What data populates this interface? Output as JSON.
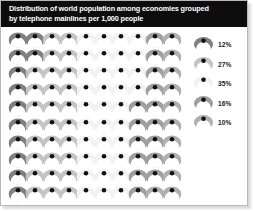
{
  "title": {
    "line1": "Distribution of world population among economies grouped",
    "line2": "by telephone mainlines per 1,000 people"
  },
  "colors": {
    "title_bar_bg": "#0d0d0d",
    "title_text": "#ffffff",
    "figure_bg": "#ffffff",
    "border": "#b9b9b9",
    "shade_1": "#808080",
    "shade_2": "#c4c4c4",
    "shade_3": "#f2f2f2",
    "shade_4": "#9f9f9f",
    "shade_5": "#b0b0b0",
    "icon_outline": "#ffffff",
    "icon_dot": "#111111"
  },
  "legend": {
    "items": [
      {
        "label": "12%",
        "shade": "#808080",
        "icon": "person-icon"
      },
      {
        "label": "27%",
        "shade": "#c4c4c4",
        "icon": "person-icon"
      },
      {
        "label": "35%",
        "shade": "#f2f2f2",
        "icon": "person-icon"
      },
      {
        "label": "16%",
        "shade": "#9f9f9f",
        "icon": "person-icon"
      },
      {
        "label": "10%",
        "shade": "#b0b0b0",
        "icon": "person-icon"
      }
    ]
  },
  "chart_data": {
    "type": "pictogram",
    "title": "Distribution of world population among economies grouped by telephone mainlines per 1,000 people",
    "xlabel": "",
    "ylabel": "",
    "unit": "1 icon = 1% of world population",
    "grid_rows": 10,
    "grid_cols": 10,
    "total_icons": 100,
    "categories": [
      "12%",
      "27%",
      "35%",
      "16%",
      "10%"
    ],
    "values": [
      12,
      27,
      35,
      16,
      10
    ],
    "series": [
      {
        "name": "group-1",
        "value": 12,
        "shade": "#808080"
      },
      {
        "name": "group-2",
        "value": 27,
        "shade": "#c4c4c4"
      },
      {
        "name": "group-3",
        "value": 35,
        "shade": "#f2f2f2"
      },
      {
        "name": "group-4",
        "value": 16,
        "shade": "#9f9f9f"
      },
      {
        "name": "group-5",
        "value": 10,
        "shade": "#b0b0b0"
      }
    ],
    "legend_position": "right",
    "grid": false,
    "cell_shades": [
      [
        "#808080",
        "#808080",
        "#c4c4c4",
        "#c4c4c4",
        "#f2f2f2",
        "#f2f2f2",
        "#f2f2f2",
        "#f2f2f2",
        "#9f9f9f",
        "#b0b0b0"
      ],
      [
        "#808080",
        "#808080",
        "#c4c4c4",
        "#c4c4c4",
        "#f2f2f2",
        "#f2f2f2",
        "#f2f2f2",
        "#f2f2f2",
        "#9f9f9f",
        "#b0b0b0"
      ],
      [
        "#808080",
        "#c4c4c4",
        "#c4c4c4",
        "#c4c4c4",
        "#f2f2f2",
        "#f2f2f2",
        "#f2f2f2",
        "#f2f2f2",
        "#9f9f9f",
        "#b0b0b0"
      ],
      [
        "#808080",
        "#c4c4c4",
        "#c4c4c4",
        "#c4c4c4",
        "#f2f2f2",
        "#f2f2f2",
        "#f2f2f2",
        "#f2f2f2",
        "#9f9f9f",
        "#b0b0b0"
      ],
      [
        "#808080",
        "#c4c4c4",
        "#c4c4c4",
        "#c4c4c4",
        "#f2f2f2",
        "#f2f2f2",
        "#f2f2f2",
        "#9f9f9f",
        "#9f9f9f",
        "#b0b0b0"
      ],
      [
        "#808080",
        "#c4c4c4",
        "#c4c4c4",
        "#c4c4c4",
        "#f2f2f2",
        "#f2f2f2",
        "#f2f2f2",
        "#9f9f9f",
        "#9f9f9f",
        "#b0b0b0"
      ],
      [
        "#808080",
        "#c4c4c4",
        "#c4c4c4",
        "#c4c4c4",
        "#f2f2f2",
        "#f2f2f2",
        "#f2f2f2",
        "#9f9f9f",
        "#9f9f9f",
        "#b0b0b0"
      ],
      [
        "#808080",
        "#c4c4c4",
        "#c4c4c4",
        "#c4c4c4",
        "#f2f2f2",
        "#f2f2f2",
        "#f2f2f2",
        "#9f9f9f",
        "#9f9f9f",
        "#b0b0b0"
      ],
      [
        "#808080",
        "#c4c4c4",
        "#c4c4c4",
        "#c4c4c4",
        "#f2f2f2",
        "#f2f2f2",
        "#f2f2f2",
        "#9f9f9f",
        "#9f9f9f",
        "#b0b0b0"
      ],
      [
        "#808080",
        "#c4c4c4",
        "#c4c4c4",
        "#c4c4c4",
        "#f2f2f2",
        "#f2f2f2",
        "#f2f2f2",
        "#9f9f9f",
        "#b0b0b0",
        "#b0b0b0"
      ]
    ]
  }
}
